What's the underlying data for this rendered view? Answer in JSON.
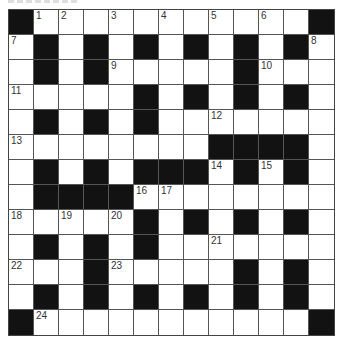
{
  "puzzle": {
    "rows": 13,
    "cols": 13,
    "layout": [
      "#....,.....,#",
      ".#.#.#.#.#.#.",
      ".#.#.....#...",
      ".....#.#.#.#.",
      ".#.#.#.......",
      "........####.",
      ".#.#.###.#.#.",
      ".####........",
      ".....#.#.#.#.",
      ".#.#.#.......",
      "...#.....#.#.",
      ".#.#.#.#.#.#.",
      "#...........#"
    ],
    "numbers": [
      {
        "r": 0,
        "c": 1,
        "n": "1"
      },
      {
        "r": 0,
        "c": 2,
        "n": "2"
      },
      {
        "r": 0,
        "c": 4,
        "n": "3"
      },
      {
        "r": 0,
        "c": 6,
        "n": "4"
      },
      {
        "r": 0,
        "c": 8,
        "n": "5"
      },
      {
        "r": 0,
        "c": 10,
        "n": "6"
      },
      {
        "r": 1,
        "c": 0,
        "n": "7"
      },
      {
        "r": 1,
        "c": 12,
        "n": "8"
      },
      {
        "r": 2,
        "c": 4,
        "n": "9"
      },
      {
        "r": 2,
        "c": 10,
        "n": "10"
      },
      {
        "r": 3,
        "c": 0,
        "n": "11"
      },
      {
        "r": 4,
        "c": 8,
        "n": "12"
      },
      {
        "r": 5,
        "c": 0,
        "n": "13"
      },
      {
        "r": 6,
        "c": 8,
        "n": "14"
      },
      {
        "r": 6,
        "c": 10,
        "n": "15"
      },
      {
        "r": 7,
        "c": 5,
        "n": "16"
      },
      {
        "r": 7,
        "c": 6,
        "n": "17"
      },
      {
        "r": 8,
        "c": 0,
        "n": "18"
      },
      {
        "r": 8,
        "c": 2,
        "n": "19"
      },
      {
        "r": 8,
        "c": 4,
        "n": "20"
      },
      {
        "r": 9,
        "c": 8,
        "n": "21"
      },
      {
        "r": 10,
        "c": 0,
        "n": "22"
      },
      {
        "r": 10,
        "c": 4,
        "n": "23"
      },
      {
        "r": 12,
        "c": 1,
        "n": "24"
      }
    ],
    "colors": {
      "block": "#121212",
      "cell": "#ffffff",
      "border": "#555555",
      "number": "#333333"
    }
  }
}
